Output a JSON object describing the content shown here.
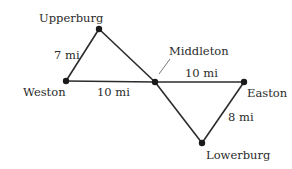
{
  "diagram": {
    "type": "road-map-graph",
    "towns": [
      {
        "id": "upperburg",
        "label": "Upperburg",
        "x": 99,
        "y": 29
      },
      {
        "id": "weston",
        "label": "Weston",
        "x": 66,
        "y": 81
      },
      {
        "id": "middleton",
        "label": "Middleton",
        "x": 155,
        "y": 82
      },
      {
        "id": "easton",
        "label": "Easton",
        "x": 244,
        "y": 82
      },
      {
        "id": "lowerburg",
        "label": "Lowerburg",
        "x": 202,
        "y": 143
      }
    ],
    "roads": [
      {
        "from": "weston",
        "to": "upperburg",
        "label": "7 mi"
      },
      {
        "from": "upperburg",
        "to": "middleton",
        "label": ""
      },
      {
        "from": "weston",
        "to": "middleton",
        "label": "10 mi"
      },
      {
        "from": "middleton",
        "to": "easton",
        "label": "10 mi"
      },
      {
        "from": "middleton",
        "to": "lowerburg",
        "label": ""
      },
      {
        "from": "lowerburg",
        "to": "easton",
        "label": "8 mi"
      }
    ]
  }
}
